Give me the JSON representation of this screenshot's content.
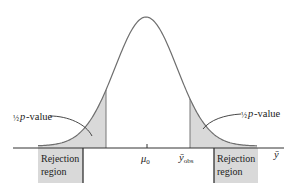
{
  "diagram": {
    "type": "normal-curve-hypothesis-test",
    "colors": {
      "curve": "#6e6e6e",
      "shade": "#d9d9d9",
      "axis": "#333333",
      "text": "#222222",
      "box_border": "#333333"
    },
    "curve": {
      "center_x": 146,
      "peak_y": 17,
      "baseline_y": 146,
      "sigma_px": 31,
      "x_start": 38,
      "x_end": 257
    },
    "axis": {
      "y": 148,
      "x_start": 13,
      "x_end": 284,
      "label": "ȳ"
    },
    "tick": {
      "x": 147,
      "label": "μ",
      "label_sub": "0"
    },
    "obs": {
      "x": 190,
      "label": "ȳ",
      "label_sub": "obs"
    },
    "left_cut_x": 106,
    "labels": {
      "left_pvalue_frac": "½",
      "left_pvalue_text": "p-value",
      "right_pvalue_frac": "½",
      "right_pvalue_text": "p-value"
    },
    "rejection_regions": [
      {
        "line1": "Rejection",
        "line2": "region",
        "x": 38,
        "y": 148,
        "w": 45,
        "h": 35,
        "border_side": "right"
      },
      {
        "line1": "Rejection",
        "line2": "region",
        "x": 214,
        "y": 148,
        "w": 44,
        "h": 35,
        "border_side": "left"
      }
    ]
  }
}
